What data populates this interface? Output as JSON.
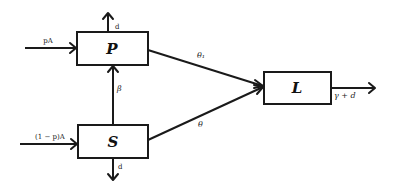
{
  "diagram": {
    "type": "compartmental-flow",
    "nodes": [
      {
        "id": "P",
        "label": "P"
      },
      {
        "id": "S",
        "label": "S"
      },
      {
        "id": "L",
        "label": "L"
      }
    ],
    "edges": [
      {
        "from": "input",
        "to": "P",
        "label": "pA"
      },
      {
        "from": "input",
        "to": "S",
        "label": "(1 − p)A"
      },
      {
        "from": "P",
        "to": "out",
        "label": "d"
      },
      {
        "from": "S",
        "to": "out",
        "label": "d"
      },
      {
        "from": "S",
        "to": "P",
        "label": "β"
      },
      {
        "from": "P",
        "to": "L",
        "label": "θ₁"
      },
      {
        "from": "S",
        "to": "L",
        "label": "θ"
      },
      {
        "from": "L",
        "to": "out",
        "label": "γ + d"
      }
    ]
  },
  "labels": {
    "P": "P",
    "S": "S",
    "L": "L",
    "pA": "pA",
    "one_minus_pA": "(1 − p)A",
    "dP": "d",
    "dS": "d",
    "beta": "β",
    "theta1": "θ₁",
    "theta": "θ",
    "gamma_d": "γ + d"
  }
}
